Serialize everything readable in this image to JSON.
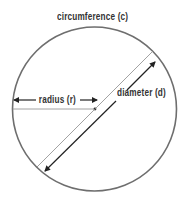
{
  "diagram": {
    "labels": {
      "circumference": "circumference (c)",
      "radius": "radius (r)",
      "diameter": "diameter (d)"
    },
    "colors": {
      "circle": "#6e6e6e",
      "guide_line": "#8a8a8a",
      "arrow": "#222222",
      "text": "#333333",
      "background": "#ffffff"
    },
    "geometry": {
      "center": [
        95,
        109
      ],
      "radius": 82
    }
  }
}
